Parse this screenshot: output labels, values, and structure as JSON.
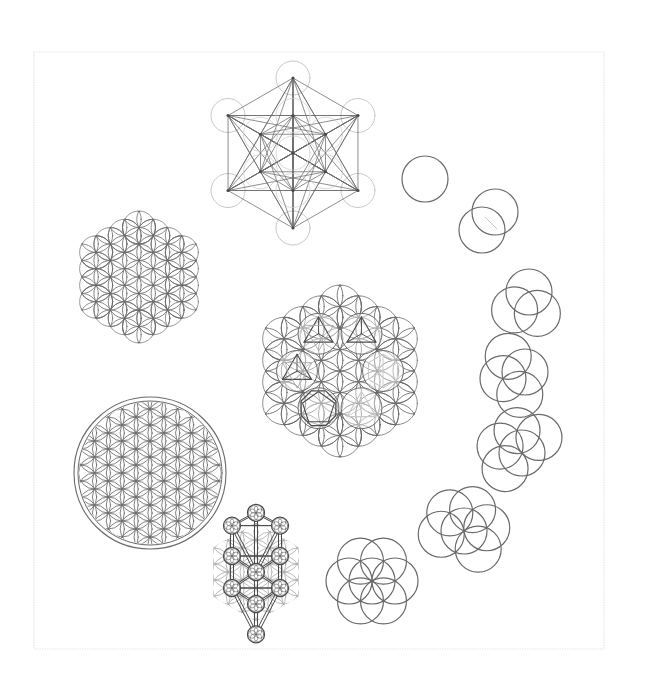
{
  "canvas": {
    "width": 646,
    "height": 688,
    "background": "#ffffff"
  },
  "colors": {
    "stroke": "#6a6a6a",
    "stroke_dark": "#4a4a4a",
    "stroke_light": "#a8a8a8",
    "stroke_faint": "#c8c8c8",
    "frame": "#e4e4e4"
  },
  "frame": {
    "x": 34,
    "y": 52,
    "width": 570,
    "height": 597
  },
  "figures": {
    "metatrons_cube": {
      "label": "metatrons-cube",
      "cx": 293,
      "cy": 153,
      "spacing": 37.5,
      "circle_r": 17
    },
    "flower_hexagon_left": {
      "label": "flower-of-life-hexagon",
      "cx": 139,
      "cy": 277,
      "r": 16.5,
      "rings": 3,
      "clip_outer": true
    },
    "flower_circle": {
      "label": "flower-of-life-circle",
      "cx": 150,
      "cy": 473,
      "r": 16,
      "rings": 2,
      "outer_r1": 72,
      "outer_r2": 76
    },
    "central_hexagon": {
      "label": "fruit-of-life-platonic-solids",
      "cx": 340,
      "cy": 371,
      "r": 21.5,
      "rings": 3,
      "solids": [
        "tetrahedron",
        "hexahedron",
        "icosahedron",
        "dodecahedron",
        "octahedron",
        "star-tetrahedron"
      ]
    },
    "tree_of_life": {
      "label": "tree-of-life",
      "cx": 256,
      "cy": 572,
      "r": 16,
      "sphere_r": 8.5
    },
    "genesis_sequence": {
      "label": "genesis-circle-sequence",
      "r": 23,
      "steps": [
        {
          "count": 1,
          "cx": 425,
          "cy": 179
        },
        {
          "count": 2,
          "cx": 488,
          "cy": 221
        },
        {
          "count": 3,
          "cx": 529,
          "cy": 292
        },
        {
          "count": 4,
          "cx": 525,
          "cy": 372
        },
        {
          "count": 5,
          "cx": 522,
          "cy": 453
        },
        {
          "count": 6,
          "cx": 464,
          "cy": 531
        },
        {
          "count": 7,
          "cx": 372,
          "cy": 581
        }
      ]
    }
  }
}
